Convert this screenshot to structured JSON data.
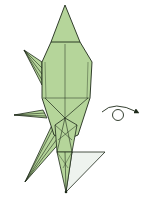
{
  "diagram": {
    "type": "origami-step",
    "colors": {
      "paper_front": "#b5d59a",
      "paper_shade": "#a3c786",
      "paper_back": "#eef3ee",
      "line": "#1e2a1a",
      "background": "#ffffff"
    },
    "symbols": [
      {
        "name": "turn-over-arrow",
        "meaning": "turn the model over"
      }
    ]
  }
}
